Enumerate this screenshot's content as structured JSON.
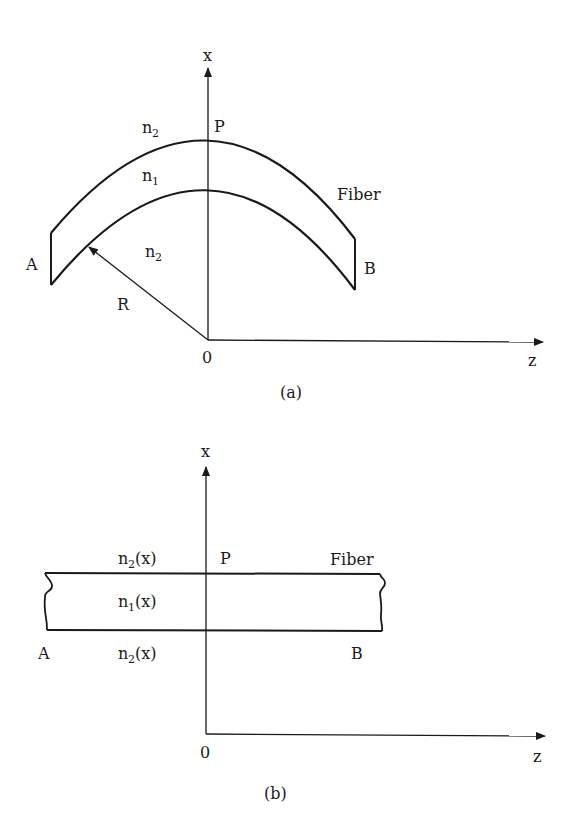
{
  "figure_a": {
    "caption": "(a)",
    "axis_x_label": "x",
    "axis_z_label": "z",
    "origin_label": "0",
    "point_p_label": "P",
    "end_a_label": "A",
    "end_b_label": "B",
    "fiber_label": "Fiber",
    "radius_label": "R",
    "outer_index": {
      "base": "n",
      "sub": "2"
    },
    "core_index": {
      "base": "n",
      "sub": "1"
    },
    "inner_index": {
      "base": "n",
      "sub": "2"
    }
  },
  "figure_b": {
    "caption": "(b)",
    "axis_x_label": "x",
    "axis_z_label": "z",
    "origin_label": "0",
    "point_p_label": "P",
    "end_a_label": "A",
    "end_b_label": "B",
    "fiber_label": "Fiber",
    "upper_index": {
      "base": "n",
      "sub": "2",
      "arg": "(x)"
    },
    "core_index": {
      "base": "n",
      "sub": "1",
      "arg": "(x)"
    },
    "lower_index": {
      "base": "n",
      "sub": "2",
      "arg": "(x)"
    }
  },
  "colors": {
    "ink": "#1a1a1a",
    "background": "#ffffff"
  }
}
